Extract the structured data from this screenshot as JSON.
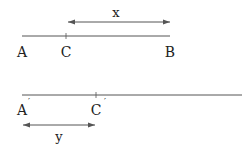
{
  "diagram": {
    "top_segment": {
      "points": [
        {
          "label": "A",
          "x": 22
        },
        {
          "label": "C",
          "x": 66
        },
        {
          "label": "B",
          "x": 170
        }
      ],
      "measure": {
        "label": "x",
        "from": "C",
        "to": "B"
      }
    },
    "bottom_segment": {
      "points": [
        {
          "label": "A",
          "prime": "′",
          "x": 22
        },
        {
          "label": "C",
          "prime": "′",
          "x": 96
        }
      ],
      "measure": {
        "label": "y",
        "from": "A′",
        "to": "C′"
      }
    },
    "colors": {
      "line": "#555555",
      "text": "#222222"
    }
  }
}
